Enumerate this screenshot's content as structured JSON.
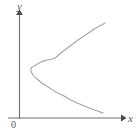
{
  "figure": {
    "name": "parabola-opening-left-graph",
    "width": 136,
    "height": 136,
    "background_color": "#ffffff"
  },
  "labels": {
    "y_axis": "y",
    "x_axis": "x",
    "origin": "0"
  },
  "colors": {
    "axis": "#6e6e6e",
    "curve": "#a6a6a6",
    "label": "#5a5a5a",
    "background": "#ffffff"
  },
  "chart_data": {
    "type": "line",
    "title": "",
    "subtitle": "",
    "xlabel": "x",
    "ylabel": "y",
    "grid": false,
    "legend": null,
    "annotations": [
      "0"
    ],
    "axes": {
      "x_axis": {
        "label": "x",
        "orientation": "horizontal",
        "pixel_y": 118,
        "pixel_x_start": 8,
        "pixel_x_end": 124,
        "arrow": "right",
        "tick_labels": []
      },
      "y_axis": {
        "label": "y",
        "orientation": "vertical",
        "pixel_x": 19,
        "pixel_y_start": 118,
        "pixel_y_end": 12,
        "arrow": "up",
        "tick_labels": []
      },
      "origin_pixel": [
        19,
        118
      ]
    },
    "curve": {
      "name": "leftward-opening parabola",
      "shape": "parabola",
      "opens": "left",
      "vertex_pixel": [
        31,
        69
      ],
      "endpoints_pixel": [
        [
          105,
          23
        ],
        [
          103,
          113
        ]
      ],
      "stroke_color": "#a6a6a6",
      "stroke_width": 1,
      "points_pixel": [
        [
          105,
          23
        ],
        [
          96,
          28
        ],
        [
          87,
          34
        ],
        [
          78,
          40
        ],
        [
          70,
          46
        ],
        [
          62,
          52
        ],
        [
          55,
          58
        ],
        [
          47,
          60
        ],
        [
          41,
          62
        ],
        [
          36,
          65
        ],
        [
          32,
          67
        ],
        [
          31,
          69
        ],
        [
          31,
          71
        ],
        [
          33,
          75
        ],
        [
          37,
          79
        ],
        [
          42,
          83
        ],
        [
          48,
          87
        ],
        [
          56,
          92
        ],
        [
          64,
          96
        ],
        [
          73,
          101
        ],
        [
          82,
          105
        ],
        [
          92,
          109
        ],
        [
          103,
          113
        ]
      ]
    }
  }
}
